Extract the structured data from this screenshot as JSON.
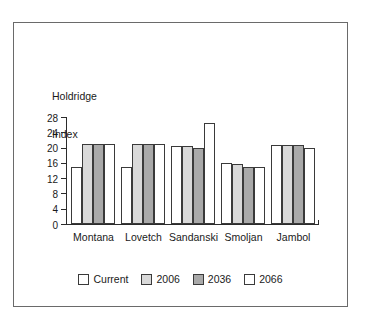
{
  "chart_data": {
    "type": "bar",
    "title": "",
    "xlabel": "",
    "ylabel": "Holdridge Index",
    "ylabel_lines": [
      "Holdridge",
      "Index"
    ],
    "categories": [
      "Montana",
      "Lovetch",
      "Sandanski",
      "Smoljan",
      "Jambol"
    ],
    "series": [
      {
        "name": "Current",
        "color": "#ffffff",
        "values": [
          15,
          15,
          20.5,
          16,
          20.8
        ]
      },
      {
        "name": "2006",
        "color": "#d9d9d9",
        "values": [
          21,
          21,
          20.5,
          15.8,
          20.8
        ]
      },
      {
        "name": "2036",
        "color": "#a9a9a9",
        "values": [
          21,
          21,
          20,
          15,
          20.8
        ]
      },
      {
        "name": "2066",
        "color": "#ffffff",
        "values": [
          21,
          21,
          26.5,
          15,
          19.8
        ]
      }
    ],
    "ylim": [
      0,
      28
    ],
    "yticks": [
      0,
      4,
      8,
      12,
      16,
      20,
      24,
      28
    ],
    "ytick_labels": [
      "0",
      "4",
      "8",
      "12",
      "16",
      "20",
      "24",
      "28"
    ],
    "grid": false,
    "legend_position": "bottom",
    "legend_entries": [
      "Current",
      "2006",
      "2036",
      "2066"
    ]
  }
}
